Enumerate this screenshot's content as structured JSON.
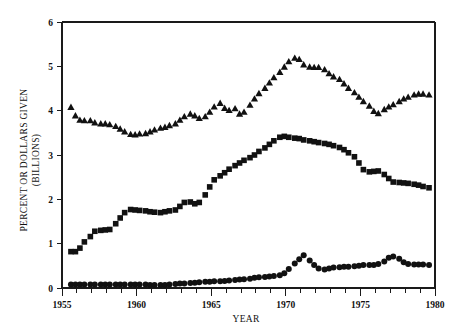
{
  "chart_data": {
    "type": "scatter",
    "title": "",
    "xlabel": "YEAR",
    "ylabel": "PERCENT OR DOLLARS GIVEN (BILLIONS)",
    "ylabel_line1": "PERCENT OR DOLLARS GIVEN",
    "ylabel_line2": "(BILLIONS)",
    "xlim": [
      1955,
      1980
    ],
    "ylim": [
      0,
      6
    ],
    "xticks_major": [
      1955,
      1960,
      1965,
      1970,
      1975,
      1980
    ],
    "xticks_major_labels": [
      "1955",
      "1960",
      "1965",
      "1970",
      "1975",
      "1980"
    ],
    "xticks_minor_step": 1,
    "yticks": [
      0,
      1,
      2,
      3,
      4,
      5,
      6
    ],
    "ytick_labels": [
      "0",
      "1",
      "2",
      "3",
      "4",
      "5",
      "6"
    ],
    "grid": false,
    "legend": "none",
    "marker_color": "#111111",
    "series": [
      {
        "name": "triangle-series",
        "marker": "triangle",
        "x": [
          1955.6,
          1955.9,
          1956.2,
          1956.5,
          1956.9,
          1957.2,
          1957.6,
          1957.9,
          1958.2,
          1958.6,
          1958.9,
          1959.2,
          1959.6,
          1959.9,
          1960.2,
          1960.6,
          1960.9,
          1961.2,
          1961.6,
          1961.9,
          1962.2,
          1962.6,
          1962.9,
          1963.2,
          1963.6,
          1963.9,
          1964.2,
          1964.6,
          1964.9,
          1965.2,
          1965.6,
          1965.9,
          1966.2,
          1966.6,
          1966.9,
          1967.2,
          1967.6,
          1967.9,
          1968.2,
          1968.6,
          1968.9,
          1969.2,
          1969.6,
          1969.9,
          1970.2,
          1970.6,
          1970.9,
          1971.2,
          1971.6,
          1971.9,
          1972.2,
          1972.6,
          1972.9,
          1973.2,
          1973.6,
          1973.9,
          1974.2,
          1974.6,
          1974.9,
          1975.2,
          1975.6,
          1975.9,
          1976.2,
          1976.6,
          1976.9,
          1977.2,
          1977.6,
          1977.9,
          1978.2,
          1978.6,
          1978.9,
          1979.2,
          1979.6
        ],
        "y": [
          4.07,
          3.88,
          3.78,
          3.77,
          3.77,
          3.72,
          3.7,
          3.7,
          3.68,
          3.64,
          3.58,
          3.52,
          3.46,
          3.45,
          3.47,
          3.48,
          3.52,
          3.56,
          3.6,
          3.62,
          3.66,
          3.7,
          3.78,
          3.86,
          3.92,
          3.88,
          3.82,
          3.86,
          3.96,
          4.08,
          4.16,
          4.05,
          4.0,
          4.04,
          3.92,
          3.96,
          4.12,
          4.26,
          4.38,
          4.5,
          4.62,
          4.74,
          4.86,
          4.98,
          5.1,
          5.18,
          5.15,
          5.03,
          4.98,
          4.97,
          4.97,
          4.92,
          4.83,
          4.76,
          4.7,
          4.6,
          4.5,
          4.4,
          4.3,
          4.2,
          4.1,
          3.98,
          3.93,
          4.02,
          4.08,
          4.13,
          4.2,
          4.26,
          4.3,
          4.35,
          4.37,
          4.37,
          4.35
        ]
      },
      {
        "name": "square-series",
        "marker": "square",
        "x": [
          1955.6,
          1955.9,
          1956.2,
          1956.5,
          1956.9,
          1957.2,
          1957.6,
          1957.9,
          1958.2,
          1958.6,
          1958.9,
          1959.2,
          1959.6,
          1959.9,
          1960.2,
          1960.6,
          1960.9,
          1961.2,
          1961.6,
          1961.9,
          1962.2,
          1962.6,
          1962.9,
          1963.2,
          1963.6,
          1963.9,
          1964.2,
          1964.6,
          1964.9,
          1965.2,
          1965.6,
          1965.9,
          1966.2,
          1966.6,
          1966.9,
          1967.2,
          1967.6,
          1967.9,
          1968.2,
          1968.6,
          1968.9,
          1969.2,
          1969.6,
          1969.9,
          1970.2,
          1970.6,
          1970.9,
          1971.2,
          1971.6,
          1971.9,
          1972.2,
          1972.6,
          1972.9,
          1973.2,
          1973.6,
          1973.9,
          1974.2,
          1974.6,
          1974.9,
          1975.2,
          1975.6,
          1975.9,
          1976.2,
          1976.6,
          1976.9,
          1977.2,
          1977.6,
          1977.9,
          1978.2,
          1978.6,
          1978.9,
          1979.2,
          1979.6
        ],
        "y": [
          0.82,
          0.82,
          0.9,
          1.04,
          1.16,
          1.28,
          1.3,
          1.31,
          1.32,
          1.45,
          1.58,
          1.7,
          1.77,
          1.76,
          1.75,
          1.74,
          1.72,
          1.71,
          1.7,
          1.72,
          1.74,
          1.76,
          1.84,
          1.93,
          1.94,
          1.9,
          1.93,
          2.1,
          2.28,
          2.44,
          2.53,
          2.6,
          2.68,
          2.76,
          2.82,
          2.88,
          2.94,
          3.0,
          3.08,
          3.16,
          3.24,
          3.32,
          3.4,
          3.42,
          3.4,
          3.38,
          3.37,
          3.34,
          3.32,
          3.3,
          3.28,
          3.26,
          3.24,
          3.21,
          3.17,
          3.12,
          3.05,
          2.96,
          2.82,
          2.67,
          2.62,
          2.63,
          2.64,
          2.56,
          2.47,
          2.39,
          2.38,
          2.37,
          2.36,
          2.34,
          2.32,
          2.29,
          2.26
        ]
      },
      {
        "name": "circle-series",
        "marker": "circle",
        "x": [
          1955.6,
          1955.9,
          1956.2,
          1956.5,
          1956.9,
          1957.2,
          1957.6,
          1957.9,
          1958.2,
          1958.6,
          1958.9,
          1959.2,
          1959.6,
          1959.9,
          1960.2,
          1960.6,
          1960.9,
          1961.2,
          1961.6,
          1961.9,
          1962.2,
          1962.6,
          1962.9,
          1963.2,
          1963.6,
          1963.9,
          1964.2,
          1964.6,
          1964.9,
          1965.2,
          1965.6,
          1965.9,
          1966.2,
          1966.6,
          1966.9,
          1967.2,
          1967.6,
          1967.9,
          1968.2,
          1968.6,
          1968.9,
          1969.2,
          1969.6,
          1969.9,
          1970.2,
          1970.6,
          1970.9,
          1971.2,
          1971.6,
          1971.9,
          1972.2,
          1972.6,
          1972.9,
          1973.2,
          1973.6,
          1973.9,
          1974.2,
          1974.6,
          1974.9,
          1975.2,
          1975.6,
          1975.9,
          1976.2,
          1976.6,
          1976.9,
          1977.2,
          1977.6,
          1977.9,
          1978.2,
          1978.6,
          1978.9,
          1979.2,
          1979.6
        ],
        "y": [
          0.08,
          0.08,
          0.08,
          0.08,
          0.08,
          0.08,
          0.08,
          0.08,
          0.08,
          0.08,
          0.08,
          0.08,
          0.08,
          0.08,
          0.08,
          0.08,
          0.07,
          0.07,
          0.07,
          0.07,
          0.08,
          0.09,
          0.1,
          0.1,
          0.11,
          0.12,
          0.13,
          0.14,
          0.14,
          0.15,
          0.15,
          0.16,
          0.17,
          0.18,
          0.19,
          0.2,
          0.21,
          0.23,
          0.24,
          0.25,
          0.26,
          0.27,
          0.29,
          0.33,
          0.43,
          0.55,
          0.65,
          0.74,
          0.62,
          0.52,
          0.44,
          0.42,
          0.44,
          0.46,
          0.47,
          0.48,
          0.48,
          0.49,
          0.5,
          0.52,
          0.52,
          0.52,
          0.54,
          0.6,
          0.68,
          0.71,
          0.66,
          0.58,
          0.54,
          0.53,
          0.53,
          0.53,
          0.52
        ]
      }
    ]
  }
}
